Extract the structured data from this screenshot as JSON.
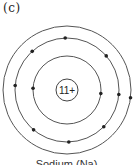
{
  "part_label": "(c)",
  "atom": {
    "nucleus_label": "11+",
    "shells": [
      {
        "name": "K",
        "electrons": 2
      },
      {
        "name": "L",
        "electrons": 8
      },
      {
        "name": "M",
        "electrons": 1
      }
    ]
  },
  "caption": "Sodium (Na)"
}
